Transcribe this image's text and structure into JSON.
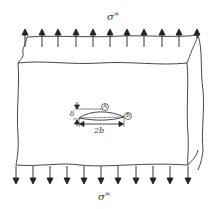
{
  "diagram": {
    "type": "fracture-mechanics-plate-with-elliptical-crack",
    "labels": {
      "top_stress": "σ",
      "top_stress_sup": "∞",
      "bottom_stress": "σ",
      "bottom_stress_sup": "∞",
      "crack_length": "2b",
      "crack_opening": "δ",
      "point_a": "A",
      "point_b": "B"
    },
    "arrows": {
      "top_count": 11,
      "bottom_count": 11,
      "direction_top": "up",
      "direction_bottom": "down"
    },
    "colors": {
      "stroke": "#333333",
      "background": "#ffffff"
    }
  }
}
